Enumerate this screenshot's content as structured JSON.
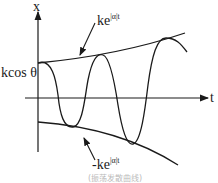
{
  "diagram": {
    "axes": {
      "y_label": "x",
      "x_label": "t"
    },
    "labels": {
      "initial_value": "kcos θ",
      "upper_envelope_base": "ke",
      "upper_envelope_exp": "|α|t",
      "lower_envelope_base": "-ke",
      "lower_envelope_exp": "|α|t"
    },
    "caption": "(振荡发散曲线)"
  },
  "colors": {
    "line": "#1a1a1a",
    "background": "#ffffff"
  }
}
